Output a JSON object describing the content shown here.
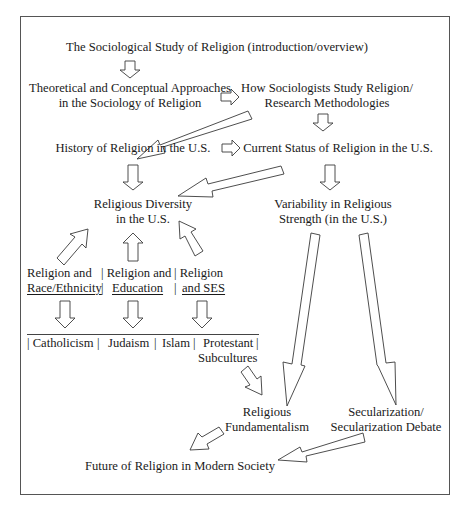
{
  "diagram": {
    "title_node": "The Sociological Study of Religion (introduction/overview)",
    "theoretical": {
      "line1": "Theoretical and Conceptual Approaches",
      "line2": "in the Sociology of Religion"
    },
    "methods": {
      "line1": "How Sociologists Study Religion/",
      "line2": "Research Methodologies"
    },
    "history": "History of Religion in the U.S.",
    "current_status": "Current Status of Religion in the U.S.",
    "diversity": {
      "line1": "Religious Diversity",
      "line2": "in the U.S."
    },
    "variability": {
      "line1": "Variability in Religious",
      "line2": "Strength (in the U.S.)"
    },
    "subtopics": [
      {
        "line1": "Religion and",
        "line2": "Race/Ethnicity"
      },
      {
        "line1": "| Religion and",
        "line2": "Education"
      },
      {
        "line1": "| Religion",
        "line2": "and SES"
      }
    ],
    "subtopic_separators": [
      "|",
      "|"
    ],
    "traditions": [
      "| Catholicism",
      "|",
      "Judaism",
      "|",
      "Islam",
      "|",
      "Protestant",
      "|"
    ],
    "traditions_line2": "Subcultures",
    "fundamentalism": {
      "line1": "Religious",
      "line2": "Fundamentalism"
    },
    "secularization": {
      "line1": "Secularization/",
      "line2": "Secularization Debate"
    },
    "future": "Future of Religion in Modern Society",
    "colors": {
      "stroke": "#3a3a3a",
      "frame": "#555555",
      "text": "#1a1a1a",
      "background": "#ffffff"
    }
  }
}
